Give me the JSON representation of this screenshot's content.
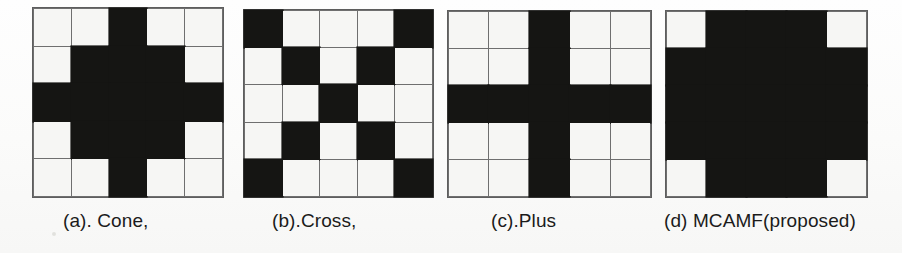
{
  "figure": {
    "type": "structuring-element-grid-figure",
    "grid_rows": 5,
    "grid_cols": 5,
    "colors": {
      "filled": "#151513",
      "empty": "#f6f6f4",
      "gridline": "#6f6f6f",
      "background": "#fdfdfc",
      "caption_text": "#1b1b1b"
    },
    "panels": [
      {
        "key": "cone",
        "caption": "(a). Cone,",
        "matrix": [
          [
            0,
            0,
            1,
            0,
            0
          ],
          [
            0,
            1,
            1,
            1,
            0
          ],
          [
            1,
            1,
            1,
            1,
            1
          ],
          [
            0,
            1,
            1,
            1,
            0
          ],
          [
            0,
            0,
            1,
            0,
            0
          ]
        ]
      },
      {
        "key": "cross",
        "caption": "(b).Cross,",
        "matrix": [
          [
            1,
            0,
            0,
            0,
            1
          ],
          [
            0,
            1,
            0,
            1,
            0
          ],
          [
            0,
            0,
            1,
            0,
            0
          ],
          [
            0,
            1,
            0,
            1,
            0
          ],
          [
            1,
            0,
            0,
            0,
            1
          ]
        ]
      },
      {
        "key": "plus",
        "caption": "(c).Plus",
        "matrix": [
          [
            0,
            0,
            1,
            0,
            0
          ],
          [
            0,
            0,
            1,
            0,
            0
          ],
          [
            1,
            1,
            1,
            1,
            1
          ],
          [
            0,
            0,
            1,
            0,
            0
          ],
          [
            0,
            0,
            1,
            0,
            0
          ]
        ]
      },
      {
        "key": "mcamf",
        "caption": "(d) MCAMF(proposed)",
        "matrix": [
          [
            0,
            1,
            1,
            1,
            0
          ],
          [
            1,
            1,
            1,
            1,
            1
          ],
          [
            1,
            1,
            1,
            1,
            1
          ],
          [
            1,
            1,
            1,
            1,
            1
          ],
          [
            0,
            1,
            1,
            1,
            0
          ]
        ]
      }
    ]
  }
}
